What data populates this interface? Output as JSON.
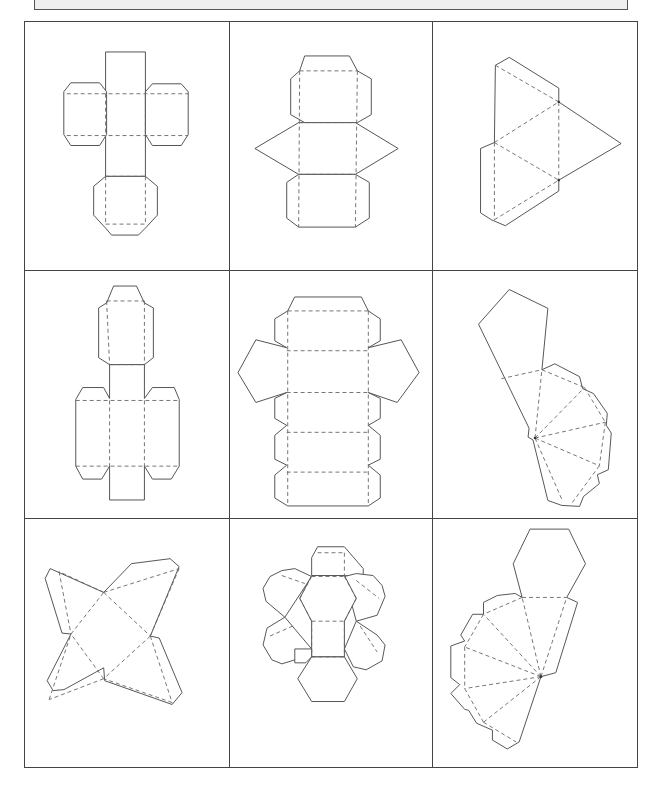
{
  "banner": {
    "text": ""
  },
  "worksheet": {
    "layout": "3x3 grid of polyhedron nets",
    "line_colors": {
      "cut_line": "#555555",
      "fold_line": "#666666",
      "banner_bg": "#efefef"
    },
    "nets": [
      {
        "row": 1,
        "col": 1,
        "label": "cube net with glue tabs"
      },
      {
        "row": 1,
        "col": 2,
        "label": "triangular prism net with glue tabs"
      },
      {
        "row": 1,
        "col": 3,
        "label": "triangular pyramid (tetrahedron) net"
      },
      {
        "row": 2,
        "col": 1,
        "label": "rectangular prism (cuboid) net"
      },
      {
        "row": 2,
        "col": 2,
        "label": "pentagonal prism net"
      },
      {
        "row": 2,
        "col": 3,
        "label": "pentagonal pyramid net"
      },
      {
        "row": 3,
        "col": 1,
        "label": "square pyramid net"
      },
      {
        "row": 3,
        "col": 2,
        "label": "hexagonal prism net"
      },
      {
        "row": 3,
        "col": 3,
        "label": "hexagonal pyramid net"
      }
    ]
  }
}
